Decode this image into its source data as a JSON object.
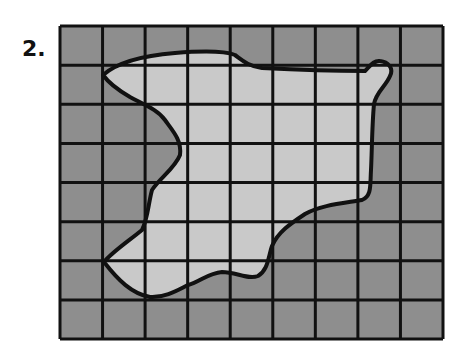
{
  "problem": {
    "number_label": "2."
  },
  "grid": {
    "columns": 9,
    "rows": 8,
    "left": 60,
    "top": 26,
    "right": 443,
    "bottom": 339
  },
  "colors": {
    "outside_fill": "#8e8e8e",
    "inside_fill": "#c9c9c9",
    "grid_line": "#111111",
    "outline": "#111111"
  },
  "shape": {
    "description": "irregular closed region outlined on square grid (area estimation)",
    "path": "M103,75 C120,60 150,55 175,53 C200,51 225,51 235,55 C242,60 248,66 262,68 C300,70 340,71 365,71 C370,66 374,60 380,61 C388,62 394,68 390,76 C386,86 376,92 374,104 C372,125 372,150 371,170 C370,185 372,196 362,200 C345,203 320,205 305,214 C290,224 278,232 272,246 C268,258 268,270 258,276 C248,280 236,272 222,272 C208,273 200,282 188,285 C178,290 165,298 150,297 C132,294 118,280 104,262 C112,252 130,240 142,230 C148,218 148,205 152,190 C160,178 175,168 180,155 C182,140 172,130 165,120 C158,110 145,105 130,97 C118,90 108,82 103,75 Z"
  }
}
